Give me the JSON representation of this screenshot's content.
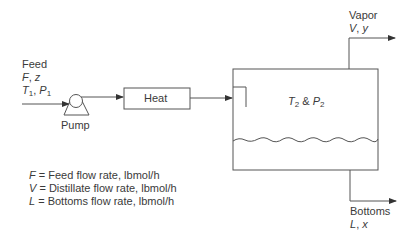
{
  "feed": {
    "title": "Feed",
    "line2_var1": "F",
    "line2_sep": ", ",
    "line2_var2": "z",
    "line3_var1": "T",
    "line3_sub1": "1",
    "line3_sep": ", ",
    "line3_var2": "P",
    "line3_sub2": "1"
  },
  "pump": {
    "label": "Pump"
  },
  "heater": {
    "label": "Heat"
  },
  "flash_drum": {
    "cond_var1": "T",
    "cond_sub1": "2",
    "cond_amp": " & ",
    "cond_var2": "P",
    "cond_sub2": "2"
  },
  "vapor": {
    "title": "Vapor",
    "var1": "V",
    "sep": ", ",
    "var2": "y"
  },
  "bottoms": {
    "title": "Bottoms",
    "var1": "L",
    "sep": ", ",
    "var2": "x"
  },
  "legend": [
    {
      "symbol": "F",
      "text": " = Feed flow rate, lbmol/h"
    },
    {
      "symbol": "V",
      "text": " = Distillate flow rate, lbmol/h"
    },
    {
      "symbol": "L",
      "text": " = Bottoms flow rate, lbmol/h"
    }
  ],
  "colors": {
    "line": "#555555",
    "text": "#3a3a3a",
    "background": "#ffffff"
  }
}
